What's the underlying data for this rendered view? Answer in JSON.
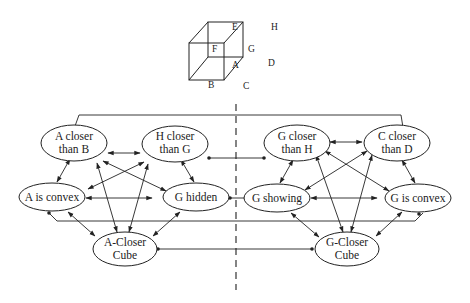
{
  "cube": {
    "labels": {
      "E": "E",
      "H": "H",
      "F": "F",
      "G": "G",
      "A": "A",
      "D": "D",
      "B": "B",
      "C": "C"
    }
  },
  "nodes": {
    "a_closer_b": [
      "A closer",
      "than B"
    ],
    "h_closer_g": [
      "H closer",
      "than G"
    ],
    "a_convex": [
      "A is convex"
    ],
    "g_hidden": [
      "G hidden"
    ],
    "a_cube": [
      "A-Closer",
      "Cube"
    ],
    "g_closer_h": [
      "G closer",
      "than H"
    ],
    "c_closer_d": [
      "C closer",
      "than D"
    ],
    "g_showing": [
      "G showing"
    ],
    "g_convex": [
      "G is convex"
    ],
    "g_cube": [
      "G-Closer",
      "Cube"
    ]
  }
}
